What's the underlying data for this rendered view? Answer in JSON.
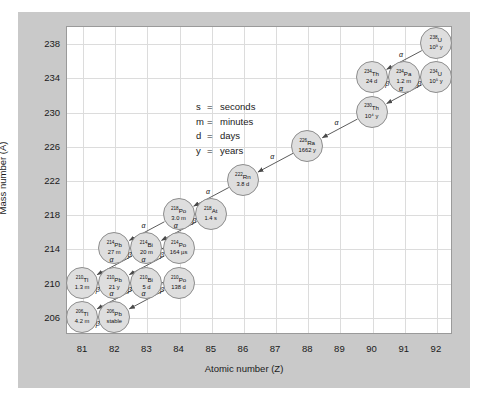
{
  "figure": {
    "panel_color": "#c9c9c9",
    "plot_background": "#ffffff",
    "node_fill": "#dedede",
    "node_stroke": "#8d8d8d",
    "grid_color": "#dcdcdc"
  },
  "axes": {
    "xlabel": "Atomic number (Z)",
    "ylabel": "Mass number (A)",
    "xticks": [
      "81",
      "82",
      "83",
      "84",
      "85",
      "86",
      "87",
      "88",
      "89",
      "90",
      "91",
      "92"
    ],
    "yticks": [
      "238",
      "234",
      "230",
      "226",
      "222",
      "218",
      "214",
      "210",
      "206"
    ],
    "element_symbols": [
      "Tl",
      "Pb",
      "Bi",
      "Po",
      "At",
      "Rn",
      "Fr",
      "Ra",
      "Ac",
      "Th",
      "Pa",
      "U"
    ]
  },
  "legend": {
    "rows": [
      {
        "symbol": "s",
        "eq": "=",
        "meaning": "seconds"
      },
      {
        "symbol": "m",
        "eq": "=",
        "meaning": "minutes"
      },
      {
        "symbol": "d",
        "eq": "=",
        "meaning": "days"
      },
      {
        "symbol": "y",
        "eq": "=",
        "meaning": "years"
      }
    ]
  },
  "chart_data": {
    "type": "scatter",
    "xlabel": "Atomic number (Z)",
    "ylabel": "Mass number (A)",
    "xlim": [
      80.5,
      92.5
    ],
    "ylim": [
      204,
      240
    ],
    "grid": true,
    "legend_position": "center",
    "nuclides": [
      {
        "id": "U238",
        "mass": "238",
        "element": "U",
        "Z": 92,
        "A": 238,
        "halflife": "10⁹ y"
      },
      {
        "id": "Th234",
        "mass": "234",
        "element": "Th",
        "Z": 90,
        "A": 234,
        "halflife": "24 d"
      },
      {
        "id": "Pa234",
        "mass": "234",
        "element": "Pa",
        "Z": 91,
        "A": 234,
        "halflife": "1.2 m"
      },
      {
        "id": "U234",
        "mass": "234",
        "element": "U",
        "Z": 92,
        "A": 234,
        "halflife": "10⁵ y"
      },
      {
        "id": "Th230",
        "mass": "230",
        "element": "Th",
        "Z": 90,
        "A": 230,
        "halflife": "10⁴ y"
      },
      {
        "id": "Ra226",
        "mass": "226",
        "element": "Ra",
        "Z": 88,
        "A": 226,
        "halflife": "1662 y"
      },
      {
        "id": "Rn222",
        "mass": "222",
        "element": "Rn",
        "Z": 86,
        "A": 222,
        "halflife": "3.8 d"
      },
      {
        "id": "Po218",
        "mass": "218",
        "element": "Po",
        "Z": 84,
        "A": 218,
        "halflife": "3.0 m"
      },
      {
        "id": "At218",
        "mass": "218",
        "element": "At",
        "Z": 85,
        "A": 218,
        "halflife": "1.4 s"
      },
      {
        "id": "Pb214",
        "mass": "214",
        "element": "Pb",
        "Z": 82,
        "A": 214,
        "halflife": "27 m"
      },
      {
        "id": "Bi214",
        "mass": "214",
        "element": "Bi",
        "Z": 83,
        "A": 214,
        "halflife": "20 m"
      },
      {
        "id": "Po214",
        "mass": "214",
        "element": "Po",
        "Z": 84,
        "A": 214,
        "halflife": "164 µs"
      },
      {
        "id": "Tl210",
        "mass": "210",
        "element": "Tl",
        "Z": 81,
        "A": 210,
        "halflife": "1.3 m"
      },
      {
        "id": "Pb210",
        "mass": "210",
        "element": "Pb",
        "Z": 82,
        "A": 210,
        "halflife": "21 y"
      },
      {
        "id": "Bi210",
        "mass": "210",
        "element": "Bi",
        "Z": 83,
        "A": 210,
        "halflife": "5 d"
      },
      {
        "id": "Po210",
        "mass": "210",
        "element": "Po",
        "Z": 84,
        "A": 210,
        "halflife": "138 d"
      },
      {
        "id": "Tl206",
        "mass": "206",
        "element": "Tl",
        "Z": 81,
        "A": 206,
        "halflife": "4.2 m"
      },
      {
        "id": "Pb206",
        "mass": "206",
        "element": "Pb",
        "Z": 82,
        "A": 206,
        "halflife": "stable"
      }
    ],
    "decays": [
      {
        "from": "U238",
        "to": "Th234",
        "mode": "α"
      },
      {
        "from": "Th234",
        "to": "Pa234",
        "mode": "β"
      },
      {
        "from": "Pa234",
        "to": "U234",
        "mode": "β"
      },
      {
        "from": "U234",
        "to": "Th230",
        "mode": "α"
      },
      {
        "from": "Th230",
        "to": "Ra226",
        "mode": "α"
      },
      {
        "from": "Ra226",
        "to": "Rn222",
        "mode": "α"
      },
      {
        "from": "Rn222",
        "to": "Po218",
        "mode": "α"
      },
      {
        "from": "Po218",
        "to": "At218",
        "mode": "β"
      },
      {
        "from": "Po218",
        "to": "Pb214",
        "mode": "α"
      },
      {
        "from": "At218",
        "to": "Bi214",
        "mode": "α"
      },
      {
        "from": "Pb214",
        "to": "Bi214",
        "mode": "β"
      },
      {
        "from": "Bi214",
        "to": "Po214",
        "mode": "β"
      },
      {
        "from": "Bi214",
        "to": "Tl210",
        "mode": "α"
      },
      {
        "from": "Po214",
        "to": "Pb210",
        "mode": "α"
      },
      {
        "from": "Tl210",
        "to": "Pb210",
        "mode": "β"
      },
      {
        "from": "Pb210",
        "to": "Bi210",
        "mode": "β"
      },
      {
        "from": "Bi210",
        "to": "Po210",
        "mode": "β"
      },
      {
        "from": "Bi210",
        "to": "Tl206",
        "mode": "α"
      },
      {
        "from": "Po210",
        "to": "Pb206",
        "mode": "α"
      },
      {
        "from": "Tl206",
        "to": "Pb206",
        "mode": "β"
      }
    ]
  }
}
